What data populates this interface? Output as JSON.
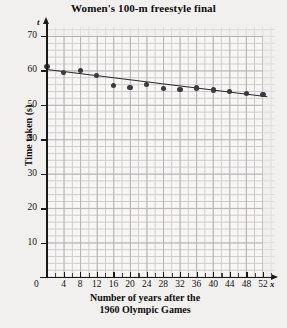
{
  "chart_data": {
    "type": "scatter",
    "title": "Women's 100-m freestyle final",
    "xlabel": "Number of years after the 1960 Olympic Games",
    "xlabel_line1": "Number of years after the",
    "xlabel_line2": "1960 Olympic Games",
    "ylabel": "Time taken (s)",
    "x_axis_variable": "x",
    "y_axis_variable": "t",
    "xlim": [
      0,
      54
    ],
    "ylim": [
      0,
      72
    ],
    "x_major_ticks": [
      0,
      4,
      8,
      12,
      16,
      20,
      24,
      28,
      32,
      36,
      40,
      44,
      48,
      52
    ],
    "x_minor_tick_step": 2,
    "y_major_ticks": [
      0,
      10,
      20,
      30,
      40,
      50,
      60,
      70
    ],
    "y_minor_tick_step": 2,
    "origin_label": "0",
    "grid": true,
    "legend": "none",
    "series": [
      {
        "name": "Winning time",
        "marker": "filled-circle",
        "color": "#3a3a42",
        "x": [
          0,
          4,
          8,
          12,
          16,
          20,
          24,
          28,
          32,
          36,
          40,
          44,
          48,
          52
        ],
        "y": [
          61.2,
          59.5,
          60.0,
          58.6,
          55.7,
          55.0,
          56.0,
          54.8,
          54.5,
          54.9,
          54.3,
          53.8,
          53.4,
          53.0
        ]
      }
    ],
    "trend_line": {
      "name": "line of best fit",
      "color": "#2b2b2b",
      "x_start": 0,
      "y_start": 60.5,
      "x_end": 53,
      "y_end": 52.6
    }
  }
}
